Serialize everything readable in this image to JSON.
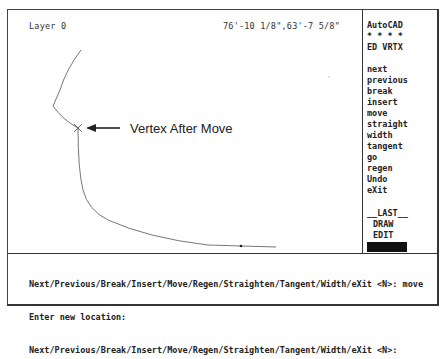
{
  "status_bar": {
    "layer": "Layer 0",
    "coordinates": "76'-10 1/8\",63'-7 5/8\""
  },
  "screen_menu": {
    "title": "AutoCAD",
    "separator": "* * * *",
    "submenu": "ED VRTX",
    "items": [
      {
        "label": "next"
      },
      {
        "label": "previous"
      },
      {
        "label": "break"
      },
      {
        "label": "insert"
      },
      {
        "label": "move"
      },
      {
        "label": "straight"
      },
      {
        "label": "width"
      },
      {
        "label": "tangent"
      },
      {
        "label": "go"
      },
      {
        "label": "regen"
      },
      {
        "label": "Undo"
      },
      {
        "label": "eXit"
      }
    ],
    "last": "__LAST__",
    "draw": "DRAW",
    "edit": "EDIT"
  },
  "annotation": {
    "label": "Vertex After Move",
    "marker": "vertex-x-marker"
  },
  "command_line": {
    "lines": [
      "Next/Previous/Break/Insert/Move/Regen/Straighten/Tangent/Width/eXit <N>: move",
      "Enter new location:",
      "Next/Previous/Break/Insert/Move/Regen/Straighten/Tangent/Width/eXit <N>:"
    ]
  },
  "colors": {
    "background": "#ffffff",
    "line": "#444444",
    "text": "#222222",
    "menu_highlight": "#111111"
  }
}
